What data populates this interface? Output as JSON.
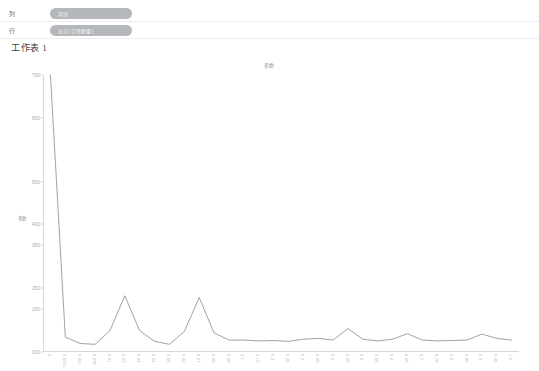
{
  "shelves": {
    "rows": [
      {
        "axis_label": "列",
        "pills": [
          {
            "text": "月份"
          }
        ]
      },
      {
        "axis_label": "行",
        "pills": [
          {
            "text": "总计(订单数量)"
          }
        ]
      }
    ]
  },
  "sheet": {
    "title": "工作表 1"
  },
  "chart_data": {
    "type": "line",
    "title": "参数",
    "xlabel": "",
    "ylabel": "参数",
    "ylim": [
      100,
      750
    ],
    "yticks": [
      100,
      200,
      250,
      350,
      400,
      500,
      650,
      750
    ],
    "ytick_labels": [
      "100",
      "200",
      "250",
      "350",
      "400",
      "500",
      "650",
      "750"
    ],
    "grid": false,
    "legend_position": "none",
    "line_color": "#8a8a8a",
    "categories": [
      "0",
      "0.0001",
      "0.001",
      "0.005",
      "0.01",
      "0.02",
      "0.03",
      "0.04",
      "0.05",
      "0.06",
      "0.07",
      "0.08",
      "0.09",
      "0.1",
      "0.15",
      "0.2",
      "0.25",
      "0.3",
      "0.35",
      "0.4",
      "0.45",
      "0.5",
      "0.55",
      "0.6",
      "0.65",
      "0.7",
      "0.75",
      "0.8",
      "0.85",
      "0.9",
      "0.95",
      "1.0"
    ],
    "values": [
      750,
      135,
      120,
      118,
      150,
      232,
      150,
      125,
      118,
      148,
      228,
      145,
      128,
      128,
      126,
      127,
      125,
      130,
      132,
      128,
      155,
      130,
      126,
      130,
      143,
      128,
      126,
      127,
      128,
      142,
      132,
      128
    ]
  },
  "colors": {
    "pill": "#b4b7bb",
    "axis": "#d8d8d8",
    "tick_text": "#a6a6a6",
    "line": "#8a8a8a",
    "background": "#ffffff"
  }
}
